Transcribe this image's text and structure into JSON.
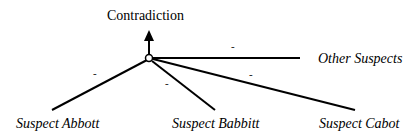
{
  "diagram": {
    "root": {
      "label": "Contradiction"
    },
    "hub": {
      "shape": "open-circle"
    },
    "nodes": [
      {
        "id": "abbott",
        "label": "Suspect Abbott",
        "edge_sign": "-"
      },
      {
        "id": "babbitt",
        "label": "Suspect Babbitt",
        "edge_sign": "-"
      },
      {
        "id": "cabot",
        "label": "Suspect Cabot",
        "edge_sign": "-"
      },
      {
        "id": "other",
        "label": "Other Suspects",
        "edge_sign": "-"
      }
    ],
    "colors": {
      "line": "#000000",
      "background": "#ffffff"
    }
  }
}
